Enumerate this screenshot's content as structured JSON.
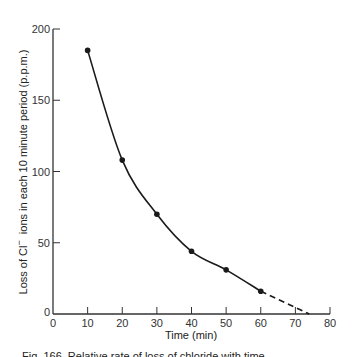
{
  "chart_data": {
    "type": "line",
    "title": "",
    "xlabel": "Time (min)",
    "ylabel": "Loss of Cl⁻ ions in each 10 minute period (p.p.m.)",
    "ylabel_parts": {
      "pre": "Loss of Cl",
      "sup": "−",
      "post": "  ions in each 10 minute period (p.p.m.)"
    },
    "xlim": [
      0,
      80
    ],
    "ylim": [
      0,
      200
    ],
    "xticks": [
      0,
      10,
      20,
      30,
      40,
      50,
      60,
      70,
      80
    ],
    "yticks": [
      0,
      50,
      100,
      150,
      200
    ],
    "grid": false,
    "legend": null,
    "series": [
      {
        "name": "Cl- loss",
        "x": [
          10,
          20,
          30,
          40,
          50,
          60
        ],
        "y": [
          185,
          108,
          70,
          44,
          31,
          16
        ],
        "style": "solid line with markers"
      },
      {
        "name": "extrapolation",
        "x": [
          60,
          74
        ],
        "y": [
          16,
          0
        ],
        "style": "dashed"
      }
    ]
  },
  "caption": "Fig. 166.  Relative rate of loss of chloride with time",
  "colors": {
    "line": "#1a1a1a",
    "axis": "#333333",
    "background": "#ffffff"
  }
}
